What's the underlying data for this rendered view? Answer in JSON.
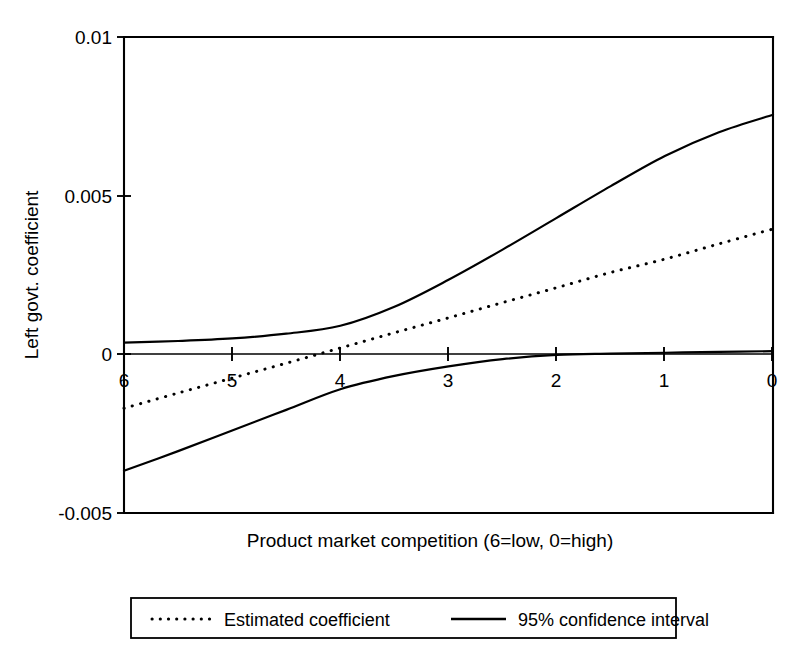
{
  "chart_data": {
    "type": "line",
    "title": "",
    "xlabel": "Product market competition (6=low, 0=high)",
    "ylabel": "Left govt.  coefficient",
    "x": [
      6,
      5.5,
      5,
      4.5,
      4,
      3.5,
      3,
      2.5,
      2,
      1.5,
      1,
      0.5,
      0
    ],
    "xlim": [
      6,
      0
    ],
    "ylim": [
      -0.005,
      0.01
    ],
    "x_reversed": true,
    "grid": false,
    "xticks": [
      "6",
      "5",
      "4",
      "3",
      "2",
      "1",
      "0"
    ],
    "xtick_values": [
      6,
      5,
      4,
      3,
      2,
      1,
      0
    ],
    "yticks": [
      "0.01",
      "0.005",
      "0",
      "-0.005"
    ],
    "ytick_values": [
      0.01,
      0.005,
      0,
      -0.005
    ],
    "zero_line": 0,
    "legend_position": "below-axes",
    "series": [
      {
        "name": "Estimated coefficient",
        "style": "dotted",
        "color": "#000000",
        "values": [
          -0.0017,
          -0.00122,
          -0.00075,
          -0.00028,
          0.0002,
          0.00068,
          0.00115,
          0.00163,
          0.0021,
          0.00258,
          0.003,
          0.00348,
          0.00395
        ]
      },
      {
        "name": "95% confidence interval upper",
        "style": "solid",
        "color": "#000000",
        "values": [
          0.00037,
          0.00042,
          0.0005,
          0.00065,
          0.0009,
          0.0015,
          0.00235,
          0.0033,
          0.0043,
          0.0053,
          0.00625,
          0.007,
          0.00755
        ]
      },
      {
        "name": "95% confidence interval lower",
        "style": "solid",
        "color": "#000000",
        "values": [
          -0.00367,
          -0.00305,
          -0.0024,
          -0.00175,
          -0.0011,
          -0.00068,
          -0.00038,
          -0.00015,
          -2e-05,
          2e-05,
          5e-05,
          8e-05,
          0.0001
        ]
      }
    ],
    "legend": [
      {
        "label": "Estimated coefficient",
        "style": "dotted",
        "color": "#000000"
      },
      {
        "label": "95% confidence interval",
        "style": "solid",
        "color": "#000000"
      }
    ]
  },
  "colors": {
    "background": "#ffffff",
    "foreground": "#000000"
  }
}
